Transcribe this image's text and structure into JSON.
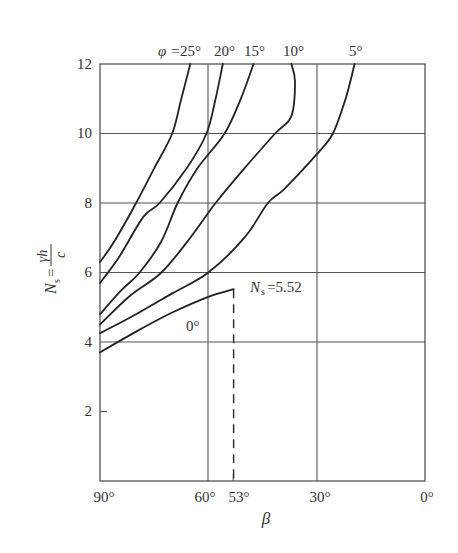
{
  "chart_data": {
    "type": "line",
    "title": "",
    "xlabel": "β",
    "ylabel": "Ns = γh / c",
    "ylabel_parts": {
      "symbol": "N",
      "sub": "s",
      "eq": "=",
      "num": "γh",
      "den": "c"
    },
    "xlim": [
      90,
      0
    ],
    "ylim": [
      0,
      12
    ],
    "x_reversed": true,
    "grid": true,
    "x_ticks": [
      {
        "value": 90,
        "label": "90°"
      },
      {
        "value": 60,
        "label": "60°"
      },
      {
        "value": 53,
        "label": "53°"
      },
      {
        "value": 30,
        "label": "30°"
      },
      {
        "value": 0,
        "label": "0°"
      }
    ],
    "y_ticks": [
      {
        "value": 2,
        "label": "2"
      },
      {
        "value": 4,
        "label": "4"
      },
      {
        "value": 6,
        "label": "6"
      },
      {
        "value": 8,
        "label": "8"
      },
      {
        "value": 10,
        "label": "10"
      },
      {
        "value": 12,
        "label": "12"
      }
    ],
    "x_gridlines": [
      60,
      30
    ],
    "y_gridlines": [
      4,
      6,
      8,
      10
    ],
    "legend_prefix": "φ =",
    "series": [
      {
        "name": "φ = 25°",
        "label": "25°",
        "points": [
          [
            90,
            6.3
          ],
          [
            86,
            6.9
          ],
          [
            80,
            8.0
          ],
          [
            75,
            9.0
          ],
          [
            70,
            10.0
          ],
          [
            67.5,
            11.0
          ],
          [
            65,
            12.0
          ]
        ]
      },
      {
        "name": "φ = 20°",
        "label": "20°",
        "points": [
          [
            90,
            5.7
          ],
          [
            85,
            6.4
          ],
          [
            78,
            7.6
          ],
          [
            73.5,
            8.0
          ],
          [
            66,
            9.0
          ],
          [
            60.5,
            10.0
          ],
          [
            58,
            11.0
          ],
          [
            56,
            12.0
          ]
        ]
      },
      {
        "name": "φ = 15°",
        "label": "15°",
        "points": [
          [
            90,
            4.8
          ],
          [
            84,
            5.5
          ],
          [
            79,
            6.0
          ],
          [
            73,
            6.9
          ],
          [
            68.5,
            8.0
          ],
          [
            63,
            9.0
          ],
          [
            55.5,
            10.0
          ],
          [
            51,
            11.0
          ],
          [
            47.5,
            12.0
          ]
        ]
      },
      {
        "name": "φ = 10°",
        "label": "10°",
        "points": [
          [
            90,
            4.5
          ],
          [
            82,
            5.3
          ],
          [
            73,
            6.0
          ],
          [
            65,
            7.0
          ],
          [
            58,
            8.0
          ],
          [
            50,
            9.0
          ],
          [
            41.5,
            10.0
          ],
          [
            37,
            10.5
          ],
          [
            36,
            11.5
          ],
          [
            37,
            12.0
          ]
        ]
      },
      {
        "name": "φ = 5°",
        "label": "5°",
        "points": [
          [
            90,
            4.25
          ],
          [
            80,
            4.8
          ],
          [
            70,
            5.4
          ],
          [
            60,
            6.0
          ],
          [
            50,
            7.0
          ],
          [
            43.5,
            8.0
          ],
          [
            39,
            8.4
          ],
          [
            30,
            9.4
          ],
          [
            25.5,
            10.0
          ],
          [
            22,
            11.0
          ],
          [
            19.5,
            12.0
          ]
        ]
      },
      {
        "name": "φ = 0°",
        "label": "0°",
        "points": [
          [
            90,
            3.7
          ],
          [
            80,
            4.3
          ],
          [
            70,
            4.85
          ],
          [
            60,
            5.3
          ],
          [
            53,
            5.52
          ]
        ]
      }
    ],
    "annotations": [
      {
        "text": "Ns=5.52",
        "symbol": "N",
        "sub": "s",
        "rest": "=5.52",
        "x": 53,
        "y": 5.52,
        "note": "end of 0° curve with dashed drop line to β = 53°"
      },
      {
        "text": "0°",
        "x": 64,
        "y": 4.6,
        "note": "label for φ = 0° curve"
      }
    ],
    "dashed_lines": [
      {
        "x": 53,
        "from_y": 0,
        "to_y": 5.52
      }
    ]
  },
  "labels": {
    "phi_prefix": "φ = ",
    "phi_25": "25°",
    "phi_20": "20°",
    "phi_15": "15°",
    "phi_10": "10°",
    "phi_5": "5°",
    "phi_0": "0°",
    "x_axis_title": "β",
    "ns_value": "=5.52",
    "ns_symbol": "N",
    "ns_sub": "s",
    "y_num": "γh",
    "y_den": "c",
    "y_eq": "=",
    "x90": "90°",
    "x60": "60°",
    "x53": "53°",
    "x30": "30°",
    "x0": "0°",
    "y2": "2",
    "y4": "4",
    "y6": "6",
    "y8": "8",
    "y10": "10",
    "y12": "12"
  }
}
